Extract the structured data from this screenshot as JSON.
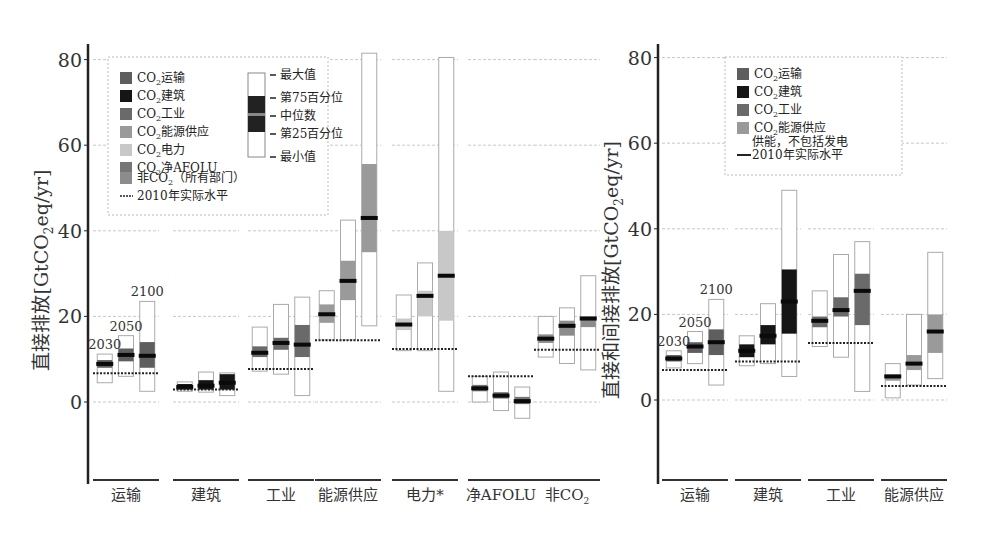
{
  "chart_data": [
    {
      "type": "box",
      "panel": "left",
      "ylabel": "直接排放[GtCO2eq/yr]",
      "ylim": [
        -17,
        84
      ],
      "yticks": [
        0,
        20,
        40,
        60,
        80
      ],
      "grid": true,
      "years": [
        "2030",
        "2050",
        "2100"
      ],
      "categories": [
        "运输",
        "建筑",
        "工业",
        "能源供应",
        "电力*",
        "净AFOLU",
        "非CO2"
      ],
      "legend": {
        "series": [
          {
            "label": "CO2运输",
            "color": "#5e5e5e"
          },
          {
            "label": "CO2建筑",
            "color": "#151515"
          },
          {
            "label": "CO2工业",
            "color": "#6a6a6a"
          },
          {
            "label": "CO2能源供应",
            "color": "#9a9a9a"
          },
          {
            "label": "CO2电力",
            "color": "#c8c8c8"
          },
          {
            "label": "CO2净AFOLU",
            "color": "#767676"
          },
          {
            "label": "非CO2（所有部门）",
            "color": "#8c8c8c"
          },
          {
            "label": "2010年实际水平",
            "kind": "dashed-line"
          }
        ],
        "box_key": [
          "最大值",
          "第75百分位",
          "中位数",
          "第25百分位",
          "最小值"
        ]
      },
      "groups": [
        {
          "category": "运输",
          "color": "#5e5e5e",
          "actual_2010": 6.7,
          "boxes": [
            {
              "year": "2030",
              "min": 4.5,
              "q25": 8.0,
              "median": 8.9,
              "q75": 9.8,
              "max": 11.2
            },
            {
              "year": "2050",
              "min": 6.0,
              "q25": 9.5,
              "median": 11.0,
              "q75": 12.5,
              "max": 15.5
            },
            {
              "year": "2100",
              "min": 2.5,
              "q25": 8.0,
              "median": 10.8,
              "q75": 14.0,
              "max": 23.5
            }
          ]
        },
        {
          "category": "建筑",
          "color": "#151515",
          "actual_2010": 2.9,
          "boxes": [
            {
              "year": "2030",
              "min": 2.5,
              "q25": 2.9,
              "median": 3.5,
              "q75": 4.2,
              "max": 4.7
            },
            {
              "year": "2050",
              "min": 2.3,
              "q25": 2.9,
              "median": 3.8,
              "q75": 5.1,
              "max": 7.0
            },
            {
              "year": "2100",
              "min": 1.5,
              "q25": 2.9,
              "median": 4.5,
              "q75": 6.5,
              "max": 6.8
            }
          ]
        },
        {
          "category": "工业",
          "color": "#6a6a6a",
          "actual_2010": 7.7,
          "boxes": [
            {
              "year": "2030",
              "min": 7.2,
              "q25": 10.5,
              "median": 11.5,
              "q75": 13.0,
              "max": 17.5
            },
            {
              "year": "2050",
              "min": 6.5,
              "q25": 12.2,
              "median": 13.8,
              "q75": 15.0,
              "max": 22.8
            },
            {
              "year": "2100",
              "min": 1.5,
              "q25": 10.5,
              "median": 13.4,
              "q75": 18.0,
              "max": 24.5
            }
          ]
        },
        {
          "category": "能源供应",
          "color": "#9a9a9a",
          "actual_2010": 14.4,
          "boxes": [
            {
              "year": "2030",
              "min": 14.5,
              "q25": 18.5,
              "median": 20.5,
              "q75": 22.8,
              "max": 26.0
            },
            {
              "year": "2050",
              "min": 14.5,
              "q25": 23.8,
              "median": 28.3,
              "q75": 33.0,
              "max": 42.5
            },
            {
              "year": "2100",
              "min": 17.8,
              "q25": 35.0,
              "median": 43.0,
              "q75": 55.6,
              "max": 81.5
            }
          ]
        },
        {
          "category": "电力*",
          "color": "#c8c8c8",
          "actual_2010": 12.4,
          "boxes": [
            {
              "year": "2030",
              "min": 12.0,
              "q25": 16.8,
              "median": 18.1,
              "q75": 19.5,
              "max": 25.0
            },
            {
              "year": "2050",
              "min": 12.0,
              "q25": 20.0,
              "median": 24.8,
              "q75": 26.0,
              "max": 32.5
            },
            {
              "year": "2100",
              "min": 2.5,
              "q25": 19.0,
              "median": 29.5,
              "q75": 40.0,
              "max": 80.5
            }
          ]
        },
        {
          "category": "净AFOLU",
          "color": "#767676",
          "actual_2010": 6.0,
          "boxes": [
            {
              "year": "2030",
              "min": 0.0,
              "q25": 2.5,
              "median": 3.2,
              "q75": 4.0,
              "max": 6.0
            },
            {
              "year": "2050",
              "min": -2.0,
              "q25": 0.8,
              "median": 1.5,
              "q75": 2.3,
              "max": 7.0
            },
            {
              "year": "2100",
              "min": -3.8,
              "q25": -0.5,
              "median": 0.2,
              "q75": 1.2,
              "max": 3.5
            }
          ]
        },
        {
          "category": "非CO2",
          "color": "#8c8c8c",
          "actual_2010": 12.2,
          "boxes": [
            {
              "year": "2030",
              "min": 10.5,
              "q25": 13.8,
              "median": 14.8,
              "q75": 15.8,
              "max": 20.0
            },
            {
              "year": "2050",
              "min": 9.0,
              "q25": 15.5,
              "median": 17.8,
              "q75": 19.0,
              "max": 22.0
            },
            {
              "year": "2100",
              "min": 7.5,
              "q25": 17.5,
              "median": 19.5,
              "q75": 20.0,
              "max": 29.5
            }
          ]
        }
      ]
    },
    {
      "type": "box",
      "panel": "right",
      "ylabel": "直接和间接排放[GtCO2eq/yr]",
      "ylim": [
        -17,
        84
      ],
      "yticks": [
        0,
        20,
        40,
        60,
        80
      ],
      "grid": true,
      "years": [
        "2030",
        "2050",
        "2100"
      ],
      "categories": [
        "运输",
        "建筑",
        "工业",
        "能源供应"
      ],
      "legend": {
        "series": [
          {
            "label": "CO2运输",
            "color": "#5e5e5e"
          },
          {
            "label": "CO2建筑",
            "color": "#151515"
          },
          {
            "label": "CO2工业",
            "color": "#6a6a6a"
          },
          {
            "label": "CO2能源供应 供能，不包括发电",
            "color": "#9a9a9a"
          },
          {
            "label": "2010年实际水平",
            "kind": "solid-line"
          }
        ]
      },
      "groups": [
        {
          "category": "运输",
          "color": "#5e5e5e",
          "actual_2010": 7.0,
          "boxes": [
            {
              "year": "2030",
              "min": 7.5,
              "q25": 9.0,
              "median": 9.7,
              "q75": 10.5,
              "max": 11.5
            },
            {
              "year": "2050",
              "min": 8.5,
              "q25": 11.0,
              "median": 12.5,
              "q75": 13.5,
              "max": 16.0
            },
            {
              "year": "2100",
              "min": 3.5,
              "q25": 10.5,
              "median": 13.5,
              "q75": 16.5,
              "max": 23.5
            }
          ]
        },
        {
          "category": "建筑",
          "color": "#151515",
          "actual_2010": 9.0,
          "boxes": [
            {
              "year": "2030",
              "min": 8.0,
              "q25": 10.0,
              "median": 11.5,
              "q75": 13.0,
              "max": 15.0
            },
            {
              "year": "2050",
              "min": 8.5,
              "q25": 13.0,
              "median": 15.0,
              "q75": 17.5,
              "max": 22.5
            },
            {
              "year": "2100",
              "min": 5.5,
              "q25": 15.5,
              "median": 23.0,
              "q75": 30.5,
              "max": 49.0
            }
          ]
        },
        {
          "category": "工业",
          "color": "#6a6a6a",
          "actual_2010": 13.3,
          "boxes": [
            {
              "year": "2030",
              "min": 12.5,
              "q25": 17.0,
              "median": 18.5,
              "q75": 19.5,
              "max": 25.5
            },
            {
              "year": "2050",
              "min": 10.0,
              "q25": 19.5,
              "median": 21.0,
              "q75": 24.0,
              "max": 34.0
            },
            {
              "year": "2100",
              "min": 2.0,
              "q25": 17.5,
              "median": 25.5,
              "q75": 29.5,
              "max": 37.0
            }
          ]
        },
        {
          "category": "能源供应",
          "color": "#9a9a9a",
          "actual_2010": 3.3,
          "boxes": [
            {
              "year": "2030",
              "min": 0.5,
              "q25": 4.5,
              "median": 5.5,
              "q75": 6.0,
              "max": 8.5
            },
            {
              "year": "2050",
              "min": 3.5,
              "q25": 7.0,
              "median": 8.5,
              "q75": 10.5,
              "max": 20.0
            },
            {
              "year": "2100",
              "min": 5.0,
              "q25": 11.0,
              "median": 16.0,
              "q75": 20.0,
              "max": 34.5
            }
          ]
        }
      ]
    }
  ],
  "left": {
    "ylabel": "直接排放[GtCO",
    "ylabel_sub": "2",
    "ylabel_tail": "eq/yr]",
    "ticks": [
      "80",
      "60",
      "40",
      "20",
      "0"
    ],
    "categories": [
      "运输",
      "建筑",
      "工业",
      "能源供应",
      "电力*",
      "净AFOLU",
      "非CO"
    ],
    "cat_last_sub": "2",
    "year_labels": [
      "2030",
      "2050",
      "2100"
    ],
    "legend": {
      "items": [
        "运输",
        "建筑",
        "工业",
        "能源供应",
        "电力",
        "净AFOLU"
      ],
      "co2_prefix": "CO",
      "co2_sub": "2",
      "nonco2_a": "非CO",
      "nonco2_b": "（所有部门）",
      "actual": "2010年实际水平",
      "box_key": [
        "最大值",
        "第75百分位",
        "中位数",
        "第25百分位",
        "最小值"
      ]
    }
  },
  "right": {
    "ylabel": "直接和间接排放[GtCO",
    "ylabel_sub": "2",
    "ylabel_tail": "eq/yr]",
    "ticks": [
      "80",
      "60",
      "40",
      "20",
      "0"
    ],
    "categories": [
      "运输",
      "建筑",
      "工业",
      "能源供应"
    ],
    "year_labels": [
      "2030",
      "2050",
      "2100"
    ],
    "legend": {
      "items": [
        "运输",
        "建筑",
        "工业",
        "能源供应"
      ],
      "co2_prefix": "CO",
      "co2_sub": "2",
      "supply_note": "供能，不包括发电",
      "actual": "2010年实际水平"
    }
  }
}
